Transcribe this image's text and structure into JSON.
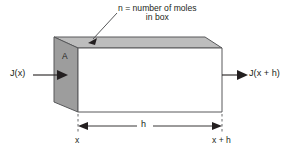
{
  "diagram": {
    "type": "physics-schematic",
    "annotations": {
      "moles_label_line1": "n = number of moles",
      "moles_label_line2": "in box",
      "area_label": "A",
      "flux_in_label": "J(x)",
      "flux_out_label": "J(x + h)",
      "thickness_label": "h",
      "left_position_label": "x",
      "right_position_label": "x + h"
    },
    "colors": {
      "front_face_fill": "#ffffff",
      "left_face_fill": "#9d9d9d",
      "top_face_fill": "#bdbdbd",
      "outline": "#58595b",
      "text": "#231f20",
      "arrow": "#231f20"
    }
  }
}
